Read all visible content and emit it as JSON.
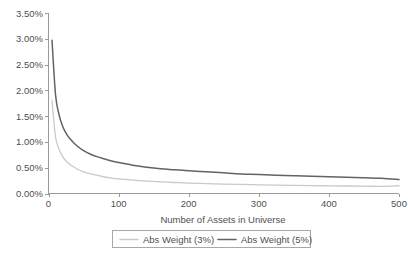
{
  "chart_data": {
    "type": "line",
    "title": "",
    "xlabel": "Number of Assets in Universe",
    "ylabel": "",
    "xlim": [
      0,
      500
    ],
    "ylim": [
      0,
      0.035
    ],
    "grid": false,
    "legend_position": "bottom",
    "xticks": [
      "0",
      "100",
      "200",
      "300",
      "400",
      "500"
    ],
    "xtick_values": [
      0,
      100,
      200,
      300,
      400,
      500
    ],
    "yticks": [
      "0.00%",
      "0.50%",
      "1.00%",
      "1.50%",
      "2.00%",
      "2.50%",
      "3.00%",
      "3.50%"
    ],
    "ytick_values": [
      0.0,
      0.005,
      0.01,
      0.015,
      0.02,
      0.025,
      0.03,
      0.035
    ],
    "x": [
      5,
      10,
      15,
      20,
      25,
      30,
      40,
      50,
      60,
      70,
      80,
      90,
      100,
      120,
      140,
      160,
      180,
      200,
      225,
      250,
      275,
      300,
      325,
      350,
      375,
      400,
      425,
      450,
      475,
      500
    ],
    "series": [
      {
        "name": "Abs Weight (3%)",
        "color": "#c9c9c9",
        "values": [
          0.018,
          0.011,
          0.0086,
          0.0072,
          0.0063,
          0.0057,
          0.0048,
          0.0042,
          0.0038,
          0.0035,
          0.0032,
          0.003,
          0.00285,
          0.0026,
          0.0024,
          0.00225,
          0.00213,
          0.00203,
          0.00192,
          0.00183,
          0.00175,
          0.00169,
          0.00163,
          0.00158,
          0.00153,
          0.00149,
          0.00145,
          0.00142,
          0.00139,
          0.0015
        ]
      },
      {
        "name": "Abs Weight (5%)",
        "color": "#636363",
        "values": [
          0.0297,
          0.0192,
          0.0153,
          0.0131,
          0.0117,
          0.0107,
          0.0093,
          0.0083,
          0.0076,
          0.0071,
          0.0067,
          0.0063,
          0.006,
          0.0055,
          0.0051,
          0.0048,
          0.0046,
          0.0044,
          0.0042,
          0.004,
          0.0038,
          0.0037,
          0.00355,
          0.00343,
          0.00333,
          0.00323,
          0.00313,
          0.00304,
          0.00295,
          0.0027
        ]
      }
    ]
  },
  "legend": {
    "entries": [
      {
        "label": "Abs Weight (3%)",
        "color": "#c9c9c9"
      },
      {
        "label": "Abs Weight (5%)",
        "color": "#636363"
      }
    ]
  }
}
